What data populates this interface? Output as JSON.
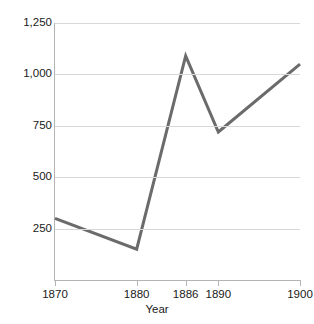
{
  "chart_data": {
    "type": "line",
    "title": "",
    "xlabel": "Year",
    "ylabel": "Union workers, in thousands",
    "x": [
      1870,
      1880,
      1886,
      1890,
      1900
    ],
    "values": [
      300,
      150,
      1090,
      720,
      1050
    ],
    "series": [
      {
        "name": "Union workers",
        "values": [
          300,
          150,
          1090,
          720,
          1050
        ],
        "color": "#6b6b6b"
      }
    ],
    "xtick_labels": [
      "1870",
      "1880",
      "1886",
      "1890",
      "1900"
    ],
    "xtick_values": [
      1870,
      1880,
      1886,
      1890,
      1900
    ],
    "ytick_labels": [
      "250",
      "500",
      "750",
      "1,000",
      "1,250"
    ],
    "ytick_values": [
      250,
      500,
      750,
      1000,
      1250
    ],
    "xlim": [
      1870,
      1900
    ],
    "ylim": [
      0,
      1250
    ],
    "grid": "horizontal",
    "legend": "none",
    "line_color": "#6b6b6b",
    "gridline_color": "#d8d8d8",
    "axis_color": "#b4b4b4",
    "background": "#ffffff"
  }
}
